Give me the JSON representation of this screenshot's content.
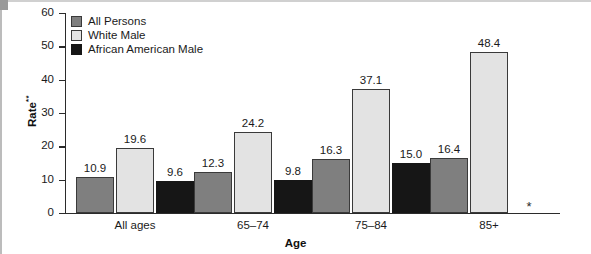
{
  "chart_data": {
    "type": "bar",
    "title": "",
    "subtitle": "",
    "xlabel": "Age",
    "ylabel": "Rate**",
    "ylabel_text": "Rate",
    "ylabel_superscript": "**",
    "categories": [
      "All ages",
      "65–74",
      "75–84",
      "85+"
    ],
    "series": [
      {
        "name": "All Persons",
        "color": "#7f7f7f",
        "values": [
          10.9,
          12.3,
          16.3,
          16.4
        ],
        "labels": [
          "10.9",
          "12.3",
          "16.3",
          "16.4"
        ]
      },
      {
        "name": "White Male",
        "color": "#e3e3e3",
        "values": [
          19.6,
          24.2,
          37.1,
          48.4
        ],
        "labels": [
          "19.6",
          "24.2",
          "37.1",
          "48.4"
        ]
      },
      {
        "name": "African American Male",
        "color": "#161616",
        "values": [
          9.6,
          9.8,
          15.0,
          null
        ],
        "labels": [
          "9.6",
          "9.8",
          "15.0",
          "*"
        ]
      }
    ],
    "ylim": [
      0,
      60
    ],
    "ytick_values": [
      0,
      10,
      20,
      30,
      40,
      50,
      60
    ],
    "ytick_labels": [
      "0",
      "10",
      "20",
      "30",
      "40",
      "50",
      "60"
    ],
    "grid": false,
    "legend_position": "top-left",
    "annotations": [
      {
        "text": "*",
        "meaning": "suppressed-or-unavailable-value",
        "category": "85+",
        "series": "African American Male"
      }
    ]
  },
  "axis": {
    "y_title_main": "Rate",
    "y_title_sup": "**",
    "x_title": "Age"
  },
  "legend": {
    "items": [
      {
        "label": "All Persons",
        "swatch": "series-all"
      },
      {
        "label": "White Male",
        "swatch": "series-white"
      },
      {
        "label": "African American Male",
        "swatch": "series-aa"
      }
    ]
  }
}
